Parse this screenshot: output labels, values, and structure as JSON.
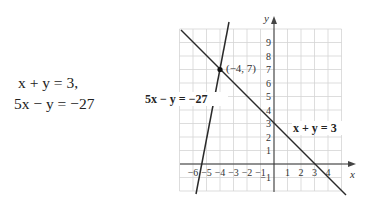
{
  "system": {
    "equation_1": "x + y = 3,",
    "equation_2": "5x − y = −27"
  },
  "graph": {
    "x_axis_label": "x",
    "y_axis_label": "y",
    "intersection_label": "(−4, 7)",
    "line_1_label": "x + y = 3",
    "line_2_label": "5x − y = −27",
    "x_ticks": [
      "−6",
      "−5",
      "−4",
      "−3",
      "−2",
      "−1",
      "1",
      "2",
      "3",
      "4"
    ],
    "y_ticks": [
      "9",
      "8",
      "7",
      "6",
      "5",
      "4",
      "3",
      "2",
      "1",
      "−1"
    ]
  },
  "chart_data": {
    "type": "line",
    "title": "",
    "xlabel": "x",
    "ylabel": "y",
    "xlim": [
      -7,
      5
    ],
    "ylim": [
      -2,
      10
    ],
    "grid": true,
    "series": [
      {
        "name": "x + y = 3",
        "points": [
          [
            -6.9,
            9.9
          ],
          [
            5.3,
            -2.3
          ]
        ]
      },
      {
        "name": "5x − y = −27",
        "points": [
          [
            -3.3,
            10.5
          ],
          [
            -5.8,
            -2
          ]
        ]
      }
    ],
    "annotations": [
      {
        "text": "(−4, 7)",
        "x": -4,
        "y": 7,
        "marker": "dot"
      }
    ],
    "x_ticks": [
      -6,
      -5,
      -4,
      -3,
      -2,
      -1,
      1,
      2,
      3,
      4
    ],
    "y_ticks": [
      -1,
      1,
      2,
      3,
      4,
      5,
      6,
      7,
      8,
      9
    ]
  }
}
